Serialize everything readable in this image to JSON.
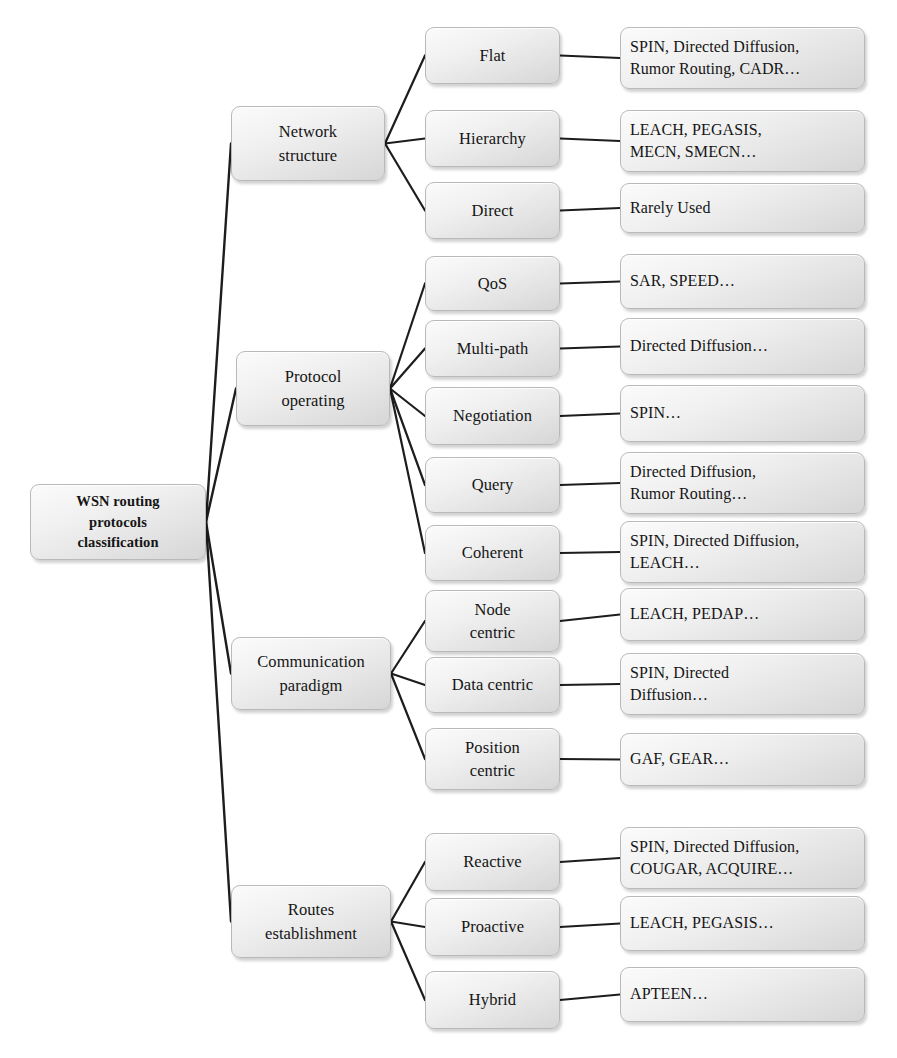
{
  "diagram": {
    "type": "tree",
    "orientation": "left-to-right",
    "root": {
      "label": "WSN routing\nprotocols\nclassification",
      "lines": [
        "WSN routing",
        "protocols",
        "classification"
      ],
      "box": {
        "x": 30,
        "y": 484,
        "w": 176,
        "h": 76
      }
    },
    "categories": [
      {
        "id": "network-structure",
        "label": "Network\nstructure",
        "lines": [
          "Network",
          "structure"
        ],
        "box": {
          "x": 231,
          "y": 106,
          "w": 154,
          "h": 75
        },
        "children": [
          {
            "id": "flat",
            "label": "Flat",
            "box": {
              "x": 425,
              "y": 27,
              "w": 135,
              "h": 57
            },
            "leaf": {
              "label": "SPIN, Directed Diffusion,\nRumor Routing, CADR…",
              "lines": [
                "SPIN, Directed Diffusion,",
                "Rumor Routing, CADR…"
              ],
              "box": {
                "x": 620,
                "y": 27,
                "w": 245,
                "h": 62
              }
            }
          },
          {
            "id": "hierarchy",
            "label": "Hierarchy",
            "box": {
              "x": 425,
              "y": 110,
              "w": 135,
              "h": 57
            },
            "leaf": {
              "label": "LEACH, PEGASIS,\nMECN, SMECN…",
              "lines": [
                "LEACH, PEGASIS,",
                "MECN, SMECN…"
              ],
              "box": {
                "x": 620,
                "y": 110,
                "w": 245,
                "h": 62
              }
            }
          },
          {
            "id": "direct",
            "label": "Direct",
            "box": {
              "x": 425,
              "y": 182,
              "w": 135,
              "h": 57
            },
            "leaf": {
              "label": "Rarely Used",
              "lines": [
                "Rarely Used"
              ],
              "box": {
                "x": 620,
                "y": 183,
                "w": 245,
                "h": 50
              }
            }
          }
        ]
      },
      {
        "id": "protocol-operating",
        "label": "Protocol\noperating",
        "lines": [
          "Protocol",
          "operating"
        ],
        "box": {
          "x": 236,
          "y": 351,
          "w": 154,
          "h": 75
        },
        "children": [
          {
            "id": "qos",
            "label": "QoS",
            "box": {
              "x": 425,
              "y": 256,
              "w": 135,
              "h": 55
            },
            "leaf": {
              "label": "SAR, SPEED…",
              "lines": [
                "SAR, SPEED…"
              ],
              "box": {
                "x": 620,
                "y": 254,
                "w": 245,
                "h": 55
              }
            }
          },
          {
            "id": "multi-path",
            "label": "Multi-path",
            "box": {
              "x": 425,
              "y": 320,
              "w": 135,
              "h": 57
            },
            "leaf": {
              "label": "Directed Diffusion…",
              "lines": [
                "Directed Diffusion…"
              ],
              "box": {
                "x": 620,
                "y": 318,
                "w": 245,
                "h": 57
              }
            }
          },
          {
            "id": "negotiation",
            "label": "Negotiation",
            "box": {
              "x": 425,
              "y": 387,
              "w": 135,
              "h": 58
            },
            "leaf": {
              "label": "SPIN…",
              "lines": [
                "SPIN…"
              ],
              "box": {
                "x": 620,
                "y": 385,
                "w": 245,
                "h": 57
              }
            }
          },
          {
            "id": "query",
            "label": "Query",
            "box": {
              "x": 425,
              "y": 457,
              "w": 135,
              "h": 56
            },
            "leaf": {
              "label": "Directed Diffusion,\nRumor Routing…",
              "lines": [
                "Directed Diffusion,",
                "Rumor Routing…"
              ],
              "box": {
                "x": 620,
                "y": 452,
                "w": 245,
                "h": 62
              }
            }
          },
          {
            "id": "coherent",
            "label": "Coherent",
            "box": {
              "x": 425,
              "y": 525,
              "w": 135,
              "h": 56
            },
            "leaf": {
              "label": "SPIN, Directed Diffusion,\nLEACH…",
              "lines": [
                "SPIN, Directed Diffusion,",
                "LEACH…"
              ],
              "box": {
                "x": 620,
                "y": 521,
                "w": 245,
                "h": 62
              }
            }
          }
        ]
      },
      {
        "id": "communication-paradigm",
        "label": "Communication\nparadigm",
        "lines": [
          "Communication",
          "paradigm"
        ],
        "box": {
          "x": 231,
          "y": 637,
          "w": 160,
          "h": 73
        },
        "children": [
          {
            "id": "node-centric",
            "label": "Node\ncentric",
            "lines": [
              "Node",
              "centric"
            ],
            "box": {
              "x": 425,
              "y": 590,
              "w": 135,
              "h": 62
            },
            "leaf": {
              "label": "LEACH, PEDAP…",
              "lines": [
                "LEACH, PEDAP…"
              ],
              "box": {
                "x": 620,
                "y": 588,
                "w": 245,
                "h": 53
              }
            }
          },
          {
            "id": "data-centric",
            "label": "Data centric",
            "lines": [
              "Data centric"
            ],
            "box": {
              "x": 425,
              "y": 657,
              "w": 135,
              "h": 56
            },
            "leaf": {
              "label": "SPIN, Directed\nDiffusion…",
              "lines": [
                "SPIN, Directed",
                "Diffusion…"
              ],
              "box": {
                "x": 620,
                "y": 653,
                "w": 245,
                "h": 62
              }
            }
          },
          {
            "id": "position-centric",
            "label": "Position\ncentric",
            "lines": [
              "Position",
              "centric"
            ],
            "box": {
              "x": 425,
              "y": 728,
              "w": 135,
              "h": 62
            },
            "leaf": {
              "label": "GAF, GEAR…",
              "lines": [
                "GAF, GEAR…"
              ],
              "box": {
                "x": 620,
                "y": 733,
                "w": 245,
                "h": 53
              }
            }
          }
        ]
      },
      {
        "id": "routes-establishment",
        "label": "Routes\nestablishment",
        "lines": [
          "Routes",
          "establishment"
        ],
        "box": {
          "x": 231,
          "y": 885,
          "w": 160,
          "h": 73
        },
        "children": [
          {
            "id": "reactive",
            "label": "Reactive",
            "box": {
              "x": 425,
              "y": 833,
              "w": 135,
              "h": 58
            },
            "leaf": {
              "label": "SPIN, Directed Diffusion,\nCOUGAR, ACQUIRE…",
              "lines": [
                "SPIN, Directed Diffusion,",
                "COUGAR, ACQUIRE…"
              ],
              "box": {
                "x": 620,
                "y": 827,
                "w": 245,
                "h": 62
              }
            }
          },
          {
            "id": "proactive",
            "label": "Proactive",
            "box": {
              "x": 425,
              "y": 898,
              "w": 135,
              "h": 58
            },
            "leaf": {
              "label": "LEACH, PEGASIS…",
              "lines": [
                "LEACH, PEGASIS…"
              ],
              "box": {
                "x": 620,
                "y": 896,
                "w": 245,
                "h": 55
              }
            }
          },
          {
            "id": "hybrid",
            "label": "Hybrid",
            "box": {
              "x": 425,
              "y": 971,
              "w": 135,
              "h": 58
            },
            "leaf": {
              "label": "APTEEN…",
              "lines": [
                "APTEEN…"
              ],
              "box": {
                "x": 620,
                "y": 967,
                "w": 245,
                "h": 55
              }
            }
          }
        ]
      }
    ]
  },
  "style": {
    "edge_color": "#1d1d1d",
    "node_border": "#b9b9b9",
    "node_fill_light": "#fbfbfb",
    "node_fill_dark": "#d6d6d6",
    "text_color": "#151515",
    "background": "#ffffff"
  }
}
